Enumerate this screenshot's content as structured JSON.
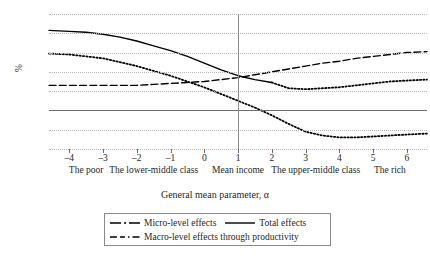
{
  "chart_data": {
    "type": "line",
    "title": "",
    "xlabel": "General mean parameter, α",
    "ylabel": "%",
    "xlim": [
      -4.6,
      6.6
    ],
    "ylim": [
      -4,
      10
    ],
    "grid": true,
    "legend_position": "bottom",
    "x_ticks": [
      "–4",
      "–3",
      "–2",
      "–1",
      "0",
      "1",
      "2",
      "3",
      "4",
      "5",
      "6"
    ],
    "x_tick_values": [
      -4,
      -3,
      -2,
      -1,
      0,
      1,
      2,
      3,
      4,
      5,
      6
    ],
    "y_ticks": [
      "10",
      "8",
      "6",
      "4",
      "2",
      "0",
      "–2",
      "–4"
    ],
    "y_tick_values": [
      10,
      8,
      6,
      4,
      2,
      0,
      -2,
      -4
    ],
    "x_category_labels": [
      {
        "label": "The poor",
        "at": -3.5
      },
      {
        "label": "The lower-middle class",
        "at": -1.5
      },
      {
        "label": "Mean income",
        "at": 1.0
      },
      {
        "label": "The upper-middle class",
        "at": 3.3
      },
      {
        "label": "The rich",
        "at": 5.5
      }
    ],
    "reference_line_x": 1,
    "x": [
      -4.6,
      -4,
      -3.5,
      -3,
      -2.5,
      -2,
      -1.5,
      -1,
      -0.5,
      0,
      0.5,
      1,
      1.5,
      2,
      2.5,
      3,
      3.5,
      4,
      4.5,
      5,
      5.5,
      6,
      6.6
    ],
    "series": [
      {
        "name": "Total effects",
        "style": "solid",
        "color": "#000000",
        "x": [
          -4.6,
          -4,
          -3.5,
          -3,
          -2.5,
          -2,
          -1.5,
          -1,
          -0.5,
          0,
          0.5,
          1,
          1.5,
          2
        ],
        "values": [
          8.3,
          8.2,
          8.1,
          7.9,
          7.6,
          7.2,
          6.7,
          6.2,
          5.6,
          4.9,
          4.2,
          3.6,
          3.2,
          2.9
        ]
      },
      {
        "name": "Macro-level effects through productivity",
        "style": "dashed",
        "color": "#000000",
        "x": [
          -4.6,
          -4,
          -3.5,
          -3,
          -2.5,
          -2,
          -1.5,
          -1,
          -0.5,
          0,
          0.5,
          1,
          1.5,
          2,
          2.5,
          3,
          3.5,
          4,
          4.5,
          5,
          5.5,
          6,
          6.6
        ],
        "values": [
          2.6,
          2.6,
          2.6,
          2.6,
          2.6,
          2.6,
          2.7,
          2.8,
          2.9,
          3.0,
          3.2,
          3.4,
          3.7,
          4.0,
          4.3,
          4.6,
          4.9,
          5.1,
          5.4,
          5.6,
          5.8,
          6.0,
          6.1
        ]
      },
      {
        "name": "Micro-level effects",
        "style": "dotted",
        "color": "#000000",
        "x": [
          -4.6,
          -4,
          -3.5,
          -3,
          -2.5,
          -2,
          -1.5,
          -1,
          -0.5,
          0,
          0.5,
          1,
          1.5,
          2,
          2.5,
          3,
          3.5,
          4,
          4.5,
          5,
          5.5,
          6,
          6.6
        ],
        "values": [
          5.9,
          5.8,
          5.6,
          5.4,
          5.0,
          4.6,
          4.1,
          3.6,
          3.0,
          2.4,
          1.7,
          1.0,
          0.3,
          -0.5,
          -1.4,
          -2.2,
          -2.6,
          -2.8,
          -2.8,
          -2.7,
          -2.6,
          -2.5,
          -2.4
        ]
      },
      {
        "name": "Micro-level effects (upper branch)",
        "style": "dotted",
        "color": "#000000",
        "x": [
          2,
          2.5,
          3,
          3.5,
          4,
          4.5,
          5,
          5.5,
          6,
          6.6
        ],
        "values": [
          2.9,
          2.3,
          2.2,
          2.3,
          2.4,
          2.6,
          2.8,
          3.0,
          3.1,
          3.2
        ]
      }
    ],
    "legend_entries": [
      {
        "label": "Micro-level effects",
        "style": "dash-dot"
      },
      {
        "label": "Total effects",
        "style": "solid"
      },
      {
        "label": "Macro-level effects through productivity",
        "style": "dashed"
      }
    ]
  }
}
